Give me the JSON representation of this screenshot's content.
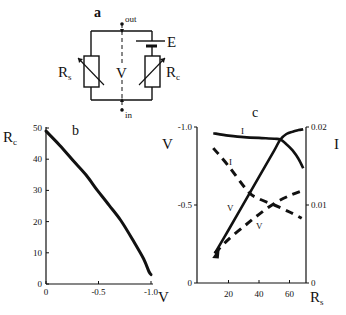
{
  "figure": {
    "panel_a": {
      "label": "a",
      "terminal_out": "out",
      "terminal_in": "in",
      "battery_label": "E",
      "center_label": "V",
      "resistor_left": {
        "main": "R",
        "sub": "s"
      },
      "resistor_right": {
        "main": "R",
        "sub": "c"
      }
    }
  },
  "chart_data": [
    {
      "id": "b",
      "panel_label": "b",
      "type": "line",
      "title": "",
      "xlabel": "V",
      "ylabel": {
        "main": "R",
        "sub": "c"
      },
      "xlim": [
        0,
        -1.0
      ],
      "ylim": [
        0,
        50
      ],
      "xticks": [
        0,
        -0.5,
        -1.0
      ],
      "xtick_labels": [
        "0",
        "-0.5",
        "-1.0"
      ],
      "yticks": [
        0,
        10,
        20,
        30,
        40,
        50
      ],
      "ytick_labels": [
        "0",
        "10",
        "20",
        "30",
        "40",
        "50"
      ],
      "grid": false,
      "series": [
        {
          "name": "Rc",
          "style": "solid",
          "x": [
            0,
            -0.13,
            -0.26,
            -0.38,
            -0.49,
            -0.6,
            -0.71,
            -0.82,
            -0.93,
            -0.98,
            -1.0
          ],
          "y": [
            49,
            44.5,
            39.5,
            35,
            30,
            25.3,
            20.5,
            14.5,
            8,
            4,
            3
          ]
        }
      ]
    },
    {
      "id": "c",
      "panel_label": "c",
      "type": "line",
      "title": "",
      "xlabel": {
        "main": "R",
        "sub": "s"
      },
      "ylabel_left": "V",
      "ylabel_right": "I",
      "xlim": [
        0,
        71
      ],
      "ylim_left": [
        0,
        -1.0
      ],
      "ylim_right": [
        0,
        0.02
      ],
      "xticks": [
        20,
        40,
        60
      ],
      "xtick_labels": [
        "20",
        "40",
        "60"
      ],
      "yticks_left": [
        0,
        -0.5,
        -1.0
      ],
      "ytick_labels_left": [
        "0",
        "-0.5",
        "-1.0"
      ],
      "yticks_right": [
        0,
        0.01,
        0.02
      ],
      "ytick_labels_right": [
        "0",
        "0.01",
        "0.02"
      ],
      "grid": false,
      "series": [
        {
          "name": "I",
          "style": "solid",
          "axis": "right",
          "label": "I",
          "x": [
            10,
            20,
            30,
            40,
            50,
            54,
            58,
            62,
            66,
            69
          ],
          "y": [
            0.0192,
            0.0189,
            0.0187,
            0.0186,
            0.0185,
            0.0184,
            0.0178,
            0.017,
            0.0159,
            0.0147
          ]
        },
        {
          "name": "V",
          "style": "solid",
          "axis": "left",
          "label": "V",
          "x": [
            11,
            20,
            30,
            40,
            50,
            54,
            58,
            62,
            66,
            69
          ],
          "y": [
            -0.19,
            -0.34,
            -0.51,
            -0.68,
            -0.85,
            -0.92,
            -0.955,
            -0.97,
            -0.98,
            -0.985
          ]
        },
        {
          "name": "I",
          "style": "dashed",
          "axis": "right",
          "label": "I",
          "x": [
            10,
            20,
            33,
            40,
            50,
            60,
            68
          ],
          "y": [
            0.0173,
            0.015,
            0.0117,
            0.0108,
            0.01,
            0.0091,
            0.0083
          ]
        },
        {
          "name": "V",
          "style": "dashed",
          "axis": "left",
          "label": "V",
          "x": [
            11,
            20,
            31,
            40,
            50,
            60,
            68
          ],
          "y": [
            -0.19,
            -0.28,
            -0.37,
            -0.44,
            -0.51,
            -0.56,
            -0.59
          ]
        }
      ]
    }
  ]
}
